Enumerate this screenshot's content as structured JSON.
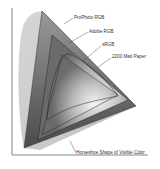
{
  "diagram": {
    "labels": {
      "prophoto": "ProPhoto RGB",
      "adobe": "Adobe RGB",
      "srgb": "sRGB",
      "paper": "2200 Matt Paper",
      "horseshoe": "Horseshoe Shape of Visible Color"
    },
    "colors": {
      "background": "#ffffff",
      "axis": "#555555",
      "horseshoe_fill": "#c8c8c8",
      "prophoto_fill": "#8a8a8a",
      "adobe_fill": "#a0a0a0",
      "srgb_fill": "#c0c0c0",
      "center_glow": "#f2f2f2",
      "outline": "#222222"
    }
  }
}
